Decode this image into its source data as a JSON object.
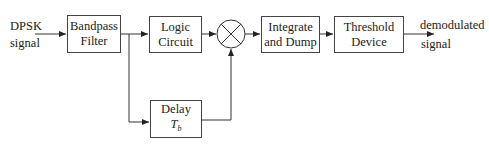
{
  "diagram": {
    "type": "block-diagram",
    "input": {
      "line1": "DPSK",
      "line2": "signal"
    },
    "output": {
      "line1": "demodulated",
      "line2": "signal"
    },
    "blocks": {
      "bandpass": {
        "line1": "Bandpass",
        "line2": "Filter"
      },
      "logic": {
        "line1": "Logic",
        "line2": "Circuit"
      },
      "delay": {
        "line1": "Delay",
        "symbol": "T",
        "subscript": "b"
      },
      "integrate": {
        "line1": "Integrate",
        "line2": "and Dump"
      },
      "threshold": {
        "line1": "Threshold",
        "line2": "Device"
      }
    },
    "multiplier": {
      "icon": "multiplier-cross-circle-icon"
    },
    "colors": {
      "line": "#333333",
      "background": "#ffffff"
    },
    "connections": [
      [
        "input",
        "bandpass"
      ],
      [
        "bandpass",
        "logic"
      ],
      [
        "bandpass",
        "delay"
      ],
      [
        "logic",
        "multiplier"
      ],
      [
        "delay",
        "multiplier"
      ],
      [
        "multiplier",
        "integrate"
      ],
      [
        "integrate",
        "threshold"
      ],
      [
        "threshold",
        "output"
      ]
    ]
  }
}
